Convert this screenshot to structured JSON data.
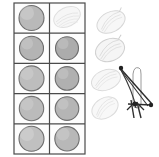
{
  "figure": {
    "title": "",
    "background_color": "#ffffff",
    "width": 159,
    "height": 157
  },
  "grid": {
    "name": "specimen-grid",
    "rows": 5,
    "columns": 2,
    "x": 14,
    "y": 3,
    "width": 71,
    "height": 151,
    "border_color": "#4a4a4a",
    "border_width": 1.2,
    "cell_background": "#fdfdfd",
    "cells": [
      {
        "row": 1,
        "column": 1,
        "content": "circle",
        "fill": "#b9b9b9",
        "stroke": "#6e6e6e",
        "radius": 12.5
      },
      {
        "row": 1,
        "column": 2,
        "content": "seed-outline",
        "fill": "#f0f0f0",
        "stroke": "#cfcfcf",
        "radius": 0
      },
      {
        "row": 2,
        "column": 1,
        "content": "circle",
        "fill": "#b4b4b4",
        "stroke": "#6b6b6b",
        "radius": 12.0
      },
      {
        "row": 2,
        "column": 2,
        "content": "circle",
        "fill": "#acacac",
        "stroke": "#6b6b6b",
        "radius": 11.5
      },
      {
        "row": 3,
        "column": 1,
        "content": "circle",
        "fill": "#bdbdbd",
        "stroke": "#717171",
        "radius": 12.5
      },
      {
        "row": 3,
        "column": 2,
        "content": "circle",
        "fill": "#b0b0b0",
        "stroke": "#6f6f6f",
        "radius": 11.8
      },
      {
        "row": 4,
        "column": 1,
        "content": "circle",
        "fill": "#bbbbbb",
        "stroke": "#737373",
        "radius": 12.2
      },
      {
        "row": 4,
        "column": 2,
        "content": "circle",
        "fill": "#b5b5b5",
        "stroke": "#707070",
        "radius": 11.8
      },
      {
        "row": 5,
        "column": 1,
        "content": "circle",
        "fill": "#c0c0c0",
        "stroke": "#6d6d6d",
        "radius": 12.5
      },
      {
        "row": 5,
        "column": 2,
        "content": "circle",
        "fill": "#b8b8b8",
        "stroke": "#6e6e6e",
        "radius": 12.2
      }
    ]
  },
  "side_sketches": {
    "name": "seed-sketch-column",
    "stroke_color": "#d0d0d0",
    "fill_color": "#f4f4f4",
    "count": 4,
    "items": [
      {
        "index": 1,
        "cx": 111,
        "cy": 22,
        "rx": 15,
        "ry": 10,
        "rotation": -28,
        "opacity": 0.85
      },
      {
        "index": 2,
        "cx": 110,
        "cy": 50,
        "rx": 15,
        "ry": 11,
        "rotation": -22,
        "opacity": 0.9
      },
      {
        "index": 3,
        "cx": 106,
        "cy": 80,
        "rx": 15,
        "ry": 10,
        "rotation": -20,
        "opacity": 0.8
      },
      {
        "index": 4,
        "cx": 105,
        "cy": 108,
        "rx": 14,
        "ry": 10,
        "rotation": -30,
        "opacity": 0.8
      }
    ]
  },
  "scribble": {
    "name": "dark-angular-scribble",
    "stroke_color": "#2b2b2b",
    "accent_color": "#8a8a8a",
    "x": 116,
    "y": 62,
    "width": 42,
    "height": 58,
    "description": "crossed dark lines with loop"
  },
  "labels": {
    "none": ""
  }
}
